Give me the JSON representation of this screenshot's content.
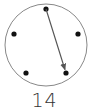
{
  "diagram": {
    "circle": {
      "cx": 46,
      "cy": 45,
      "r": 41,
      "stroke": "#888888"
    },
    "points": [
      {
        "id": 0,
        "x": 46,
        "y": 9
      },
      {
        "id": 1,
        "x": 78,
        "y": 34
      },
      {
        "id": 2,
        "x": 66,
        "y": 73
      },
      {
        "id": 3,
        "x": 26,
        "y": 73
      },
      {
        "id": 4,
        "x": 14,
        "y": 34
      }
    ],
    "arrow": {
      "from": 0,
      "to": 2,
      "color": "#555555"
    },
    "label": "14"
  }
}
